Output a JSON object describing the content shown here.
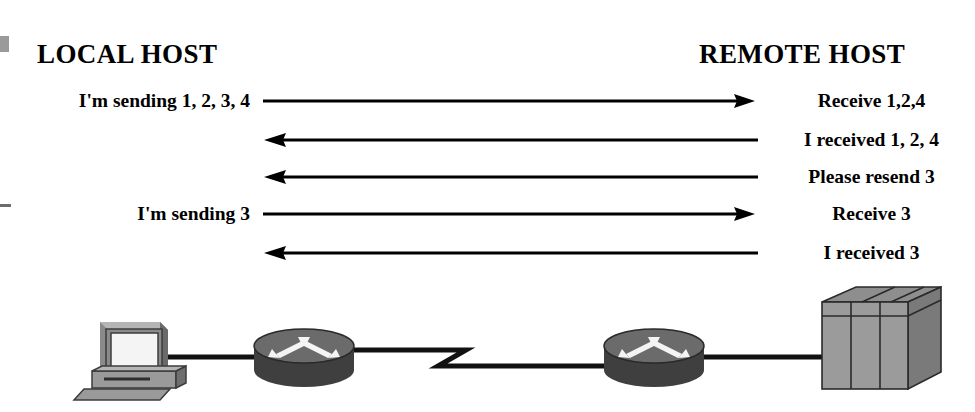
{
  "diagram": {
    "title_local": "LOCAL HOST",
    "title_remote": "REMOTE HOST",
    "exchanges": [
      {
        "left_label": "I'm sending 1, 2, 3, 4",
        "right_label": "Receive 1,2,4",
        "direction": "right",
        "y": 101
      },
      {
        "left_label": "",
        "right_label": "I received 1, 2, 4",
        "direction": "left",
        "y": 140
      },
      {
        "left_label": "",
        "right_label": "Please resend 3",
        "direction": "left",
        "y": 177
      },
      {
        "left_label": "I'm sending 3",
        "right_label": "Receive 3",
        "direction": "right",
        "y": 214
      },
      {
        "left_label": "",
        "right_label": "I received 3",
        "direction": "left",
        "y": 253
      }
    ],
    "network": {
      "nodes": [
        {
          "name": "workstation",
          "type": "pc",
          "label": ""
        },
        {
          "name": "local-router",
          "type": "router",
          "label": ""
        },
        {
          "name": "wan-link",
          "type": "serial-link",
          "label": ""
        },
        {
          "name": "remote-router",
          "type": "router",
          "label": ""
        },
        {
          "name": "server",
          "type": "server",
          "label": ""
        }
      ]
    },
    "colors": {
      "ink": "#000000",
      "background": "#ffffff",
      "device_fill": "#8f8f8f",
      "device_dark": "#3a3a3a",
      "device_light": "#b8b8b8",
      "screen": "#f2f2f2"
    }
  }
}
